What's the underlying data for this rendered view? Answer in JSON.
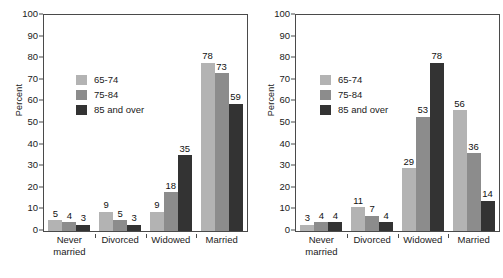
{
  "figure": {
    "background": "#ffffff",
    "panel_count": 2
  },
  "colors": {
    "series_65_74": "#b3b3b3",
    "series_75_84": "#8c8c8c",
    "series_85_over": "#333333",
    "axis": "#4a4a4a",
    "text": "#1a1a1a"
  },
  "legend": {
    "items": [
      {
        "label": "65-74",
        "color": "#b3b3b3"
      },
      {
        "label": "75-84",
        "color": "#8c8c8c"
      },
      {
        "label": "85 and over",
        "color": "#333333"
      }
    ]
  },
  "axis": {
    "ylabel": "Percent",
    "yticks": [
      "0",
      "10",
      "20",
      "30",
      "40",
      "50",
      "60",
      "70",
      "80",
      "90",
      "100"
    ],
    "ymin": 0,
    "ymax": 100,
    "ystep": 10,
    "categories": [
      {
        "line1": "Never",
        "line2": "married"
      },
      {
        "line1": "Divorced",
        "line2": ""
      },
      {
        "line1": "Widowed",
        "line2": ""
      },
      {
        "line1": "Married",
        "line2": ""
      }
    ]
  },
  "chart_data": [
    {
      "type": "bar",
      "title": "Men",
      "xlabel": "",
      "ylabel": "Percent",
      "ylim": [
        0,
        100
      ],
      "grid": false,
      "legend_position": "upper-left-inside",
      "categories": [
        "Never married",
        "Divorced",
        "Widowed",
        "Married"
      ],
      "series": [
        {
          "name": "65-74",
          "color": "#b3b3b3",
          "values": [
            5,
            9,
            9,
            78
          ]
        },
        {
          "name": "75-84",
          "color": "#8c8c8c",
          "values": [
            4,
            5,
            18,
            73
          ]
        },
        {
          "name": "85 and over",
          "color": "#333333",
          "values": [
            3,
            3,
            35,
            59
          ]
        }
      ]
    },
    {
      "type": "bar",
      "title": "Women",
      "xlabel": "",
      "ylabel": "Percent",
      "ylim": [
        0,
        100
      ],
      "grid": false,
      "legend_position": "upper-left-inside",
      "categories": [
        "Never married",
        "Divorced",
        "Widowed",
        "Married"
      ],
      "series": [
        {
          "name": "65-74",
          "color": "#b3b3b3",
          "values": [
            3,
            11,
            29,
            56
          ]
        },
        {
          "name": "75-84",
          "color": "#8c8c8c",
          "values": [
            4,
            7,
            53,
            36
          ]
        },
        {
          "name": "85 and over",
          "color": "#333333",
          "values": [
            4,
            4,
            78,
            14
          ]
        }
      ]
    }
  ]
}
